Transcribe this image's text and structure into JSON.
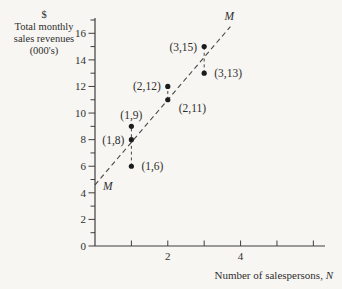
{
  "figure": {
    "y_axis_title_line1": "$",
    "y_axis_title_line2": "Total monthly",
    "y_axis_title_line3": "sales revenues",
    "y_axis_title_line4": "(000's)",
    "x_axis_title": "Number of salespersons, ",
    "x_axis_title_var": "N"
  },
  "chart_data": {
    "type": "scatter",
    "title": "",
    "xlabel": "Number of salespersons, N",
    "ylabel": "$ Total monthly sales revenues (000's)",
    "points": [
      {
        "x": 1,
        "y": 6,
        "label": "(1,6)",
        "label_placement": "right"
      },
      {
        "x": 1,
        "y": 8,
        "label": "(1,8)",
        "label_placement": "left"
      },
      {
        "x": 1,
        "y": 9,
        "label": "(1,9)",
        "label_placement": "above"
      },
      {
        "x": 2,
        "y": 11,
        "label": "(2,11)",
        "label_placement": "below-right"
      },
      {
        "x": 2,
        "y": 12,
        "label": "(2,12)",
        "label_placement": "left"
      },
      {
        "x": 3,
        "y": 13,
        "label": "(3,13)",
        "label_placement": "right"
      },
      {
        "x": 3,
        "y": 15,
        "label": "(3,15)",
        "label_placement": "left"
      }
    ],
    "fitted_line": {
      "label": "M",
      "style": "dashed",
      "intercept": 4.6,
      "slope": 3.2,
      "x_start": 0,
      "x_end": 3.72
    },
    "residual_segments": [
      {
        "x": 1,
        "y_from": 6,
        "y_to": 9
      },
      {
        "x": 2,
        "y_from": 11,
        "y_to": 12
      },
      {
        "x": 3,
        "y_from": 13,
        "y_to": 15
      }
    ],
    "x_axis": {
      "range": [
        0,
        6.32
      ],
      "ticks": [
        1,
        2,
        3,
        4,
        5,
        6
      ],
      "labeled_ticks": [
        2,
        4
      ],
      "grid": false
    },
    "y_axis": {
      "range": [
        0,
        17.15
      ],
      "major_ticks": [
        0,
        2,
        4,
        6,
        8,
        10,
        12,
        14,
        16
      ],
      "minor_ticks": [
        1,
        3,
        5,
        7,
        9,
        11,
        13,
        15,
        17
      ],
      "labeled_ticks": [
        0,
        2,
        4,
        6,
        8,
        10,
        12,
        14,
        16
      ],
      "grid": false
    },
    "legend": null
  },
  "colors": {
    "background": "#f7f6f2",
    "ink": "#2f2f2f",
    "axis": "#3f3f3f",
    "point": "#1c1c1c",
    "dashed_line": "#474747"
  }
}
